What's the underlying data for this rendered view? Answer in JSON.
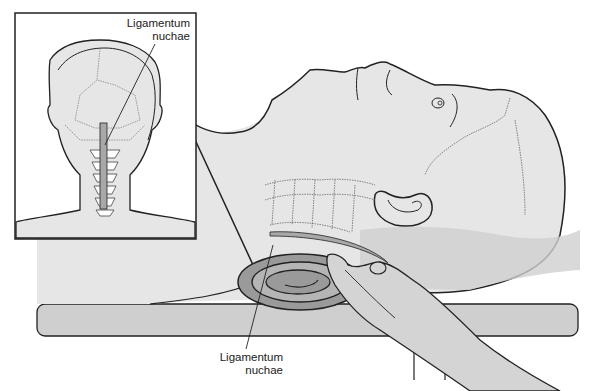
{
  "figure": {
    "labels": {
      "inset": {
        "line1": "Ligamentum",
        "line2": "nuchae"
      },
      "main": {
        "line1": "Ligamentum",
        "line2": "nuchae"
      }
    },
    "colors": {
      "skin": "#e6e6e6",
      "table": "#cfcfcf",
      "towel_outer": "#9a9a9a",
      "towel_inner": "#b5b5b5",
      "hand": "#d4d4d4",
      "shoulder_shadow": "#d0d0d0",
      "ligament": "#a8a8a8",
      "outline": "#222222",
      "inset_bg": "#ffffff"
    }
  }
}
